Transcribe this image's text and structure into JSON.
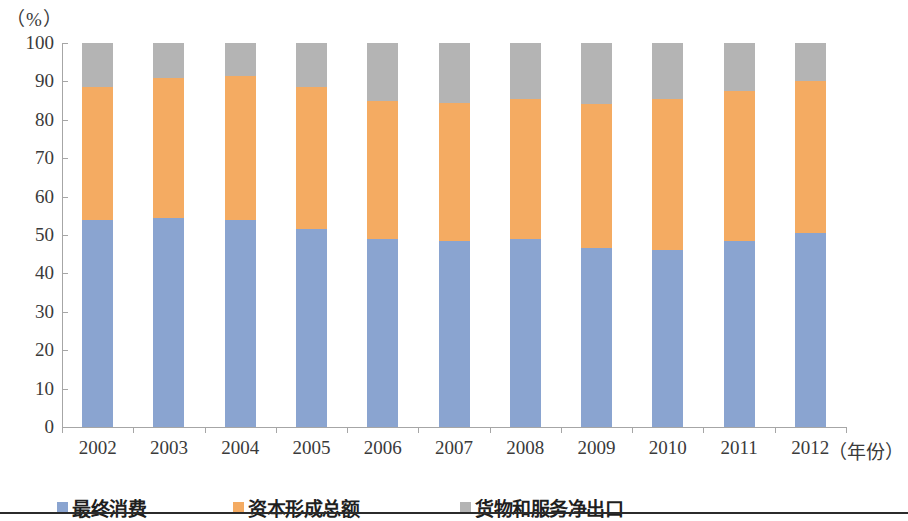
{
  "chart_data": {
    "type": "bar",
    "subtype": "stacked-percentage",
    "title": "",
    "unit_label": "（%）",
    "xlabel": "（年份）",
    "ylabel": "",
    "ylim": [
      0,
      100
    ],
    "ytick_step": 10,
    "yticks": [
      100,
      90,
      80,
      70,
      60,
      50,
      40,
      30,
      20,
      10,
      0
    ],
    "categories": [
      "2002",
      "2003",
      "2004",
      "2005",
      "2006",
      "2007",
      "2008",
      "2009",
      "2010",
      "2011",
      "2012"
    ],
    "grid": false,
    "legend_position": "bottom",
    "series": [
      {
        "name": "最终消费",
        "color": "#8aa4d0",
        "values": [
          54.0,
          54.5,
          54.0,
          51.5,
          49.0,
          48.5,
          49.0,
          46.5,
          46.0,
          48.5,
          50.5
        ]
      },
      {
        "name": "资本形成总额",
        "color": "#f4ab62",
        "values": [
          34.5,
          36.5,
          37.5,
          37.0,
          36.0,
          36.0,
          36.5,
          37.5,
          39.5,
          39.0,
          39.5
        ]
      },
      {
        "name": "货物和服务净出口",
        "color": "#b4b4b4",
        "values": [
          11.5,
          9.0,
          8.5,
          11.5,
          15.0,
          15.5,
          14.5,
          16.0,
          14.5,
          12.5,
          10.0
        ]
      }
    ]
  },
  "axes": {
    "y_unit": "（%）",
    "x_title": "（年份）"
  },
  "legend": {
    "items": [
      {
        "label": "最终消费",
        "color": "#8aa4d0"
      },
      {
        "label": "资本形成总额",
        "color": "#f4ab62"
      },
      {
        "label": "货物和服务净出口",
        "color": "#b4b4b4"
      }
    ]
  }
}
